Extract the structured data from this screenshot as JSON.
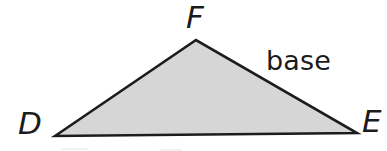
{
  "figure": {
    "kind": "geometry-diagram",
    "shape_name": "triangle",
    "background_color": "#ffffff",
    "fill_color": "#d6d6d6",
    "stroke_color": "#1c1c1c",
    "stroke_width": 2.6,
    "vertices": [
      {
        "id": "D",
        "label": "D",
        "x": 55,
        "y": 136
      },
      {
        "id": "E",
        "label": "E",
        "x": 357,
        "y": 133
      },
      {
        "id": "F",
        "label": "F",
        "x": 196,
        "y": 40
      }
    ],
    "polygon_points": "55,136 196,40 357,133",
    "labels": {
      "vertex_d": "D",
      "vertex_e": "E",
      "vertex_f": "F",
      "side_annotation": "base"
    },
    "annotated_side": {
      "text": "base",
      "from_vertex": "F",
      "to_vertex": "E"
    }
  }
}
